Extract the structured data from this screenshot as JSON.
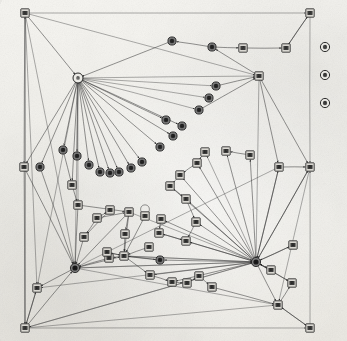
{
  "figure": {
    "caption": "",
    "background_color": "#f1f0ec",
    "edge_color": "#3b3b3b",
    "node_square_fill": "#d9d7d1",
    "node_circle_fill": "#7a7a7a",
    "node_hub_fill": "#ecebe6",
    "width": 347,
    "height": 341
  },
  "legend": {
    "position": "right",
    "items": [
      {
        "label": "7",
        "shape": "circle",
        "name": "legend-item-1"
      },
      {
        "label": "8",
        "shape": "circle",
        "name": "legend-item-2"
      },
      {
        "label": "9",
        "shape": "circle",
        "name": "legend-item-3"
      }
    ]
  },
  "chart_data": {
    "type": "diagram",
    "subtype": "node-link-graph",
    "directed": true,
    "node_count": 88,
    "edge_count": 120,
    "hubs": [
      {
        "id": "H1",
        "x": 78,
        "y": 78,
        "out_degree": 22,
        "shape": "circle-light"
      },
      {
        "id": "H2",
        "x": 256,
        "y": 262,
        "out_degree": 24,
        "shape": "circle-dark"
      }
    ],
    "nodes": [
      {
        "id": "n1",
        "x": 25,
        "y": 13,
        "shape": "square",
        "label": "1"
      },
      {
        "id": "n2",
        "x": 310,
        "y": 13,
        "shape": "square",
        "label": "2"
      },
      {
        "id": "n3",
        "x": 25,
        "y": 328,
        "shape": "square",
        "label": "3"
      },
      {
        "id": "n4",
        "x": 310,
        "y": 328,
        "shape": "square",
        "label": "4"
      },
      {
        "id": "n5",
        "x": 172,
        "y": 41,
        "shape": "circle",
        "label": "5"
      },
      {
        "id": "n6",
        "x": 212,
        "y": 47,
        "shape": "circle",
        "label": "6"
      },
      {
        "id": "n7",
        "x": 243,
        "y": 48,
        "shape": "square",
        "label": "7"
      },
      {
        "id": "n8",
        "x": 286,
        "y": 48,
        "shape": "square",
        "label": "8"
      },
      {
        "id": "n9",
        "x": 78,
        "y": 78,
        "shape": "circle-light",
        "label": "9"
      },
      {
        "id": "n10",
        "x": 259,
        "y": 76,
        "shape": "square",
        "label": "10"
      },
      {
        "id": "n11",
        "x": 216,
        "y": 86,
        "shape": "circle",
        "label": "11"
      },
      {
        "id": "n12",
        "x": 209,
        "y": 98,
        "shape": "circle",
        "label": "12"
      },
      {
        "id": "n13",
        "x": 199,
        "y": 110,
        "shape": "circle",
        "label": "13"
      },
      {
        "id": "n14",
        "x": 166,
        "y": 120,
        "shape": "circle",
        "label": "14"
      },
      {
        "id": "n15",
        "x": 182,
        "y": 126,
        "shape": "circle",
        "label": "15"
      },
      {
        "id": "n16",
        "x": 173,
        "y": 136,
        "shape": "circle",
        "label": "16"
      },
      {
        "id": "n17",
        "x": 160,
        "y": 147,
        "shape": "circle",
        "label": "17"
      },
      {
        "id": "n18",
        "x": 63,
        "y": 150,
        "shape": "circle",
        "label": "18"
      },
      {
        "id": "n19",
        "x": 77,
        "y": 156,
        "shape": "circle",
        "label": "19"
      },
      {
        "id": "n20",
        "x": 89,
        "y": 165,
        "shape": "circle",
        "label": "20"
      },
      {
        "id": "n21",
        "x": 100,
        "y": 172,
        "shape": "circle",
        "label": "21"
      },
      {
        "id": "n22",
        "x": 110,
        "y": 173,
        "shape": "circle",
        "label": "22"
      },
      {
        "id": "n23",
        "x": 119,
        "y": 172,
        "shape": "circle",
        "label": "23"
      },
      {
        "id": "n24",
        "x": 131,
        "y": 168,
        "shape": "circle",
        "label": "24"
      },
      {
        "id": "n25",
        "x": 142,
        "y": 162,
        "shape": "circle",
        "label": "25"
      },
      {
        "id": "n26",
        "x": 24,
        "y": 167,
        "shape": "square",
        "label": "26"
      },
      {
        "id": "n27",
        "x": 40,
        "y": 167,
        "shape": "circle",
        "label": "27"
      },
      {
        "id": "n28",
        "x": 279,
        "y": 167,
        "shape": "square",
        "label": "28"
      },
      {
        "id": "n29",
        "x": 310,
        "y": 167,
        "shape": "square",
        "label": "29"
      },
      {
        "id": "n30",
        "x": 72,
        "y": 185,
        "shape": "square",
        "label": "30"
      },
      {
        "id": "n31",
        "x": 78,
        "y": 205,
        "shape": "square",
        "label": "31"
      },
      {
        "id": "n32",
        "x": 97,
        "y": 218,
        "shape": "square",
        "label": "32"
      },
      {
        "id": "n33",
        "x": 84,
        "y": 237,
        "shape": "square",
        "label": "33"
      },
      {
        "id": "n34",
        "x": 129,
        "y": 212,
        "shape": "square",
        "label": "34"
      },
      {
        "id": "n35",
        "x": 145,
        "y": 216,
        "shape": "square",
        "label": "35"
      },
      {
        "id": "n36",
        "x": 125,
        "y": 234,
        "shape": "square",
        "label": "36"
      },
      {
        "id": "n37",
        "x": 124,
        "y": 256,
        "shape": "square",
        "label": "37"
      },
      {
        "id": "n38",
        "x": 109,
        "y": 258,
        "shape": "square",
        "label": "38"
      },
      {
        "id": "n39",
        "x": 149,
        "y": 247,
        "shape": "square",
        "label": "39"
      },
      {
        "id": "n40",
        "x": 160,
        "y": 260,
        "shape": "circle",
        "label": "40"
      },
      {
        "id": "n41",
        "x": 250,
        "y": 155,
        "shape": "square",
        "label": "41"
      },
      {
        "id": "n42",
        "x": 226,
        "y": 151,
        "shape": "square",
        "label": "42"
      },
      {
        "id": "n43",
        "x": 205,
        "y": 152,
        "shape": "square",
        "label": "43"
      },
      {
        "id": "n44",
        "x": 197,
        "y": 163,
        "shape": "square",
        "label": "44"
      },
      {
        "id": "n45",
        "x": 180,
        "y": 175,
        "shape": "square",
        "label": "45"
      },
      {
        "id": "n46",
        "x": 170,
        "y": 186,
        "shape": "square",
        "label": "46"
      },
      {
        "id": "n47",
        "x": 186,
        "y": 199,
        "shape": "square",
        "label": "47"
      },
      {
        "id": "n48",
        "x": 161,
        "y": 219,
        "shape": "square",
        "label": "48"
      },
      {
        "id": "n49",
        "x": 196,
        "y": 222,
        "shape": "square",
        "label": "49"
      },
      {
        "id": "n50",
        "x": 159,
        "y": 233,
        "shape": "square",
        "label": "50"
      },
      {
        "id": "n51",
        "x": 186,
        "y": 241,
        "shape": "square",
        "label": "51"
      },
      {
        "id": "n52",
        "x": 256,
        "y": 262,
        "shape": "circle-dark",
        "label": "52"
      },
      {
        "id": "n53",
        "x": 271,
        "y": 270,
        "shape": "square",
        "label": "53"
      },
      {
        "id": "n54",
        "x": 293,
        "y": 245,
        "shape": "square",
        "label": "54"
      },
      {
        "id": "n55",
        "x": 292,
        "y": 283,
        "shape": "square",
        "label": "55"
      },
      {
        "id": "n56",
        "x": 278,
        "y": 305,
        "shape": "square",
        "label": "56"
      },
      {
        "id": "n57",
        "x": 150,
        "y": 275,
        "shape": "square",
        "label": "57"
      },
      {
        "id": "n58",
        "x": 172,
        "y": 282,
        "shape": "square",
        "label": "58"
      },
      {
        "id": "n59",
        "x": 187,
        "y": 283,
        "shape": "square",
        "label": "59"
      },
      {
        "id": "n60",
        "x": 199,
        "y": 276,
        "shape": "square",
        "label": "60"
      },
      {
        "id": "n61",
        "x": 212,
        "y": 287,
        "shape": "square",
        "label": "61"
      },
      {
        "id": "n62",
        "x": 75,
        "y": 268,
        "shape": "circle-dark",
        "label": "62"
      },
      {
        "id": "n63",
        "x": 37,
        "y": 288,
        "shape": "square",
        "label": "63"
      },
      {
        "id": "n64",
        "x": 107,
        "y": 252,
        "shape": "square",
        "label": "64"
      },
      {
        "id": "n65",
        "x": 110,
        "y": 210,
        "shape": "square",
        "label": "65"
      }
    ],
    "legend_note": "Three circular legend markers at right margin"
  }
}
